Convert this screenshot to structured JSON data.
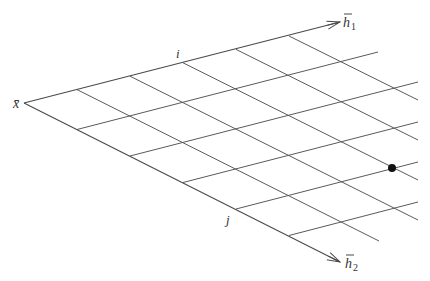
{
  "diagram": {
    "origin_label": "x̄",
    "axis1": {
      "label": "h",
      "subscript": "1",
      "bar": true
    },
    "axis2": {
      "label": "h",
      "subscript": "2",
      "bar": true
    },
    "index_labels": {
      "i": "i",
      "j": "j"
    },
    "geometry": {
      "origin": [
        24,
        103
      ],
      "u_step": [
        53,
        -13.4
      ],
      "v_step": [
        53,
        26.5
      ],
      "axis1_tip": [
        340,
        22
      ],
      "axis2_tip": [
        340,
        262
      ],
      "h1_parallel_lines": [
        {
          "m": 1,
          "end": [
            378,
            52
          ]
        },
        {
          "m": 2,
          "end": [
            418,
            82
          ]
        },
        {
          "m": 3,
          "end": [
            418,
            122
          ]
        },
        {
          "m": 4,
          "end": [
            418,
            162
          ]
        },
        {
          "m": 5,
          "end": [
            418,
            202
          ]
        }
      ],
      "h2_parallel_lines": [
        {
          "k": 1,
          "end": [
            379,
            241
          ]
        },
        {
          "k": 2,
          "end": [
            418,
            220
          ]
        },
        {
          "k": 3,
          "end": [
            418,
            180
          ]
        },
        {
          "k": 4,
          "end": [
            418,
            140
          ]
        },
        {
          "k": 5,
          "end": [
            418,
            100
          ]
        }
      ],
      "marked_point": {
        "k": 3,
        "m": 4,
        "pos": [
          392,
          168
        ],
        "radius": 4,
        "color": "#111111"
      }
    },
    "colors": {
      "line": "#5a5a5a",
      "axis": "#4a4a4a",
      "dot": "#111111",
      "background": "#ffffff"
    }
  }
}
